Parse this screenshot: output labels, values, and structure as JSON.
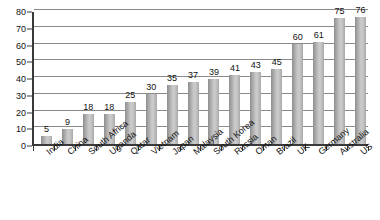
{
  "chart_data": {
    "type": "bar",
    "title": "",
    "subtitle": "",
    "xlabel": "",
    "ylabel": "",
    "ylim": [
      0,
      80
    ],
    "y_ticks": [
      0,
      10,
      20,
      30,
      40,
      50,
      60,
      70,
      80
    ],
    "grid": "horizontal",
    "legend": "none",
    "bar_color": "#c0c0c0",
    "bar_edge_color": "#8e8e8e",
    "axis_color": "#3a3a3a",
    "gridline_color": "#8a8a8a",
    "label_color": "#111111",
    "data_labels_shown": true,
    "x_tick_label_rotation": -40,
    "categories": [
      "India",
      "China",
      "South Africa",
      "Uganda",
      "Qatar",
      "Vietnam",
      "Japan",
      "Malaysia",
      "South Korea",
      "Russia",
      "Oman",
      "Brazil",
      "UK",
      "Germany",
      "Australia",
      "US"
    ],
    "values": [
      5,
      9,
      18,
      18,
      25,
      30,
      35,
      37,
      39,
      41,
      43,
      45,
      60,
      61,
      75,
      76
    ]
  }
}
